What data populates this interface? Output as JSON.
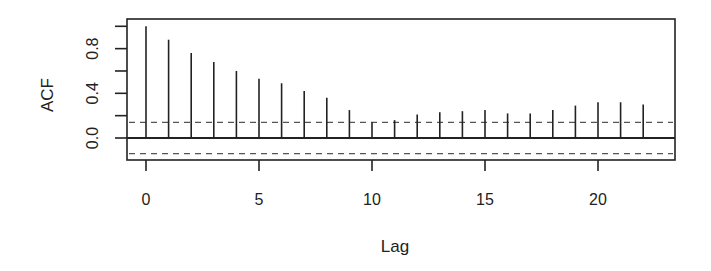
{
  "chart_data": {
    "type": "bar",
    "subtype": "acf-correlogram",
    "title": "",
    "xlabel": "Lag",
    "ylabel": "ACF",
    "x": [
      0,
      1,
      2,
      3,
      4,
      5,
      6,
      7,
      8,
      9,
      10,
      11,
      12,
      13,
      14,
      15,
      16,
      17,
      18,
      19,
      20,
      21,
      22
    ],
    "values": [
      1.0,
      0.88,
      0.76,
      0.68,
      0.6,
      0.53,
      0.49,
      0.42,
      0.36,
      0.25,
      0.14,
      0.16,
      0.21,
      0.23,
      0.24,
      0.25,
      0.22,
      0.22,
      0.25,
      0.29,
      0.32,
      0.32,
      0.3
    ],
    "confidence_band": 0.14,
    "xlim": [
      -1,
      23.2
    ],
    "ylim": [
      -0.2,
      1.05
    ],
    "x_ticks": [
      0,
      5,
      10,
      15,
      20
    ],
    "x_tick_labels": [
      "0",
      "5",
      "10",
      "15",
      "20"
    ],
    "y_ticks": [
      0.0,
      0.2,
      0.4,
      0.6,
      0.8,
      1.0
    ],
    "y_tick_labels": [
      "0.0",
      "",
      "0.4",
      "",
      "0.8",
      ""
    ],
    "grid": false,
    "legend": null,
    "colors": {
      "bars": "#222222",
      "axis": "#222222",
      "confidence": "#555555",
      "background": "#ffffff"
    }
  }
}
